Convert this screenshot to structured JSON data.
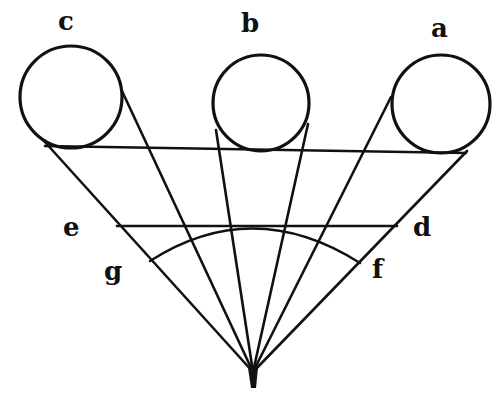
{
  "diagram": {
    "type": "geometric-perspective-figure",
    "colors": {
      "ink": "#111111",
      "background": "#ffffff"
    },
    "labels": {
      "a": "a",
      "b": "b",
      "c": "c",
      "d": "d",
      "e": "e",
      "f": "f",
      "g": "g"
    },
    "circles": [
      {
        "id": "c",
        "cx": 71,
        "cy": 97,
        "r": 51
      },
      {
        "id": "b",
        "cx": 261,
        "cy": 103,
        "r": 48
      },
      {
        "id": "a",
        "cx": 441,
        "cy": 104,
        "r": 49
      }
    ],
    "apex": {
      "x": 253,
      "y": 372
    }
  }
}
